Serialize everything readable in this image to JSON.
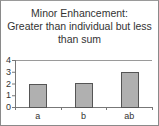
{
  "chart_data": {
    "type": "bar",
    "title": "Minor Enhancement: Greater than individual but less than sum",
    "title_lines": [
      "Minor Enhancement:",
      "Greater than individual but less",
      "than sum"
    ],
    "categories": [
      "a",
      "b",
      "ab"
    ],
    "values": [
      2,
      2.05,
      3
    ],
    "xlabel": "",
    "ylabel": "",
    "ylim": [
      0,
      4
    ],
    "yticks": [
      "0",
      "1",
      "2",
      "3",
      "4"
    ],
    "grid": true,
    "legend": null,
    "colors": {
      "bar_fill": "#b0b0b0",
      "bar_stroke": "#555555",
      "axis": "#777777",
      "gridline": "#9a9a9a"
    }
  }
}
